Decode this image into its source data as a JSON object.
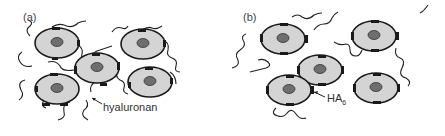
{
  "panels": [
    {
      "id": "a",
      "label": "(a)",
      "annotation": "hyaluronan"
    },
    {
      "id": "b",
      "label": "(b)",
      "annotation_main": "HA",
      "annotation_sub": "6"
    }
  ],
  "colors": {
    "cell_fill": "#d4d4d4",
    "nucleus_fill": "#6e6e6e",
    "outline": "#1a1a1a",
    "receptor": "#1a1a1a"
  }
}
